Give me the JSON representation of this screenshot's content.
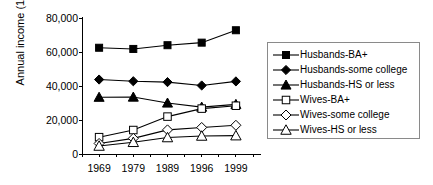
{
  "chart_data": {
    "type": "line",
    "title": "",
    "xlabel": "",
    "ylabel": "Annual income (1999 $)",
    "categories": [
      "1969",
      "1979",
      "1989",
      "1996",
      "1999"
    ],
    "ylim": [
      0,
      80000
    ],
    "ytick_labels": [
      "0",
      "20,000",
      "40,000",
      "60,000",
      "80,000"
    ],
    "ytick_values": [
      0,
      20000,
      40000,
      60000,
      80000
    ],
    "grid": false,
    "legend_position": "right",
    "series": [
      {
        "name": "Husbands-BA+",
        "marker": "filled-square",
        "values": [
          62500,
          61800,
          64000,
          65500,
          72800
        ]
      },
      {
        "name": "Husbands-some college",
        "marker": "filled-diamond",
        "values": [
          43800,
          42800,
          42300,
          40300,
          42700
        ]
      },
      {
        "name": "Husbands-HS or less",
        "marker": "filled-triangle",
        "values": [
          33400,
          33500,
          30000,
          27600,
          29200
        ]
      },
      {
        "name": "Wives-BA+",
        "marker": "open-square",
        "values": [
          9900,
          14100,
          22000,
          26700,
          28400
        ]
      },
      {
        "name": "Wives-some college",
        "marker": "open-diamond",
        "values": [
          6200,
          9200,
          14200,
          15600,
          16900
        ]
      },
      {
        "name": "Wives-HS or less",
        "marker": "open-triangle",
        "values": [
          4700,
          6900,
          9700,
          10600,
          10800
        ]
      }
    ]
  },
  "axes": {
    "y_title": "Annual income (1999 $)"
  },
  "colors": {
    "line": "#000000",
    "axis": "#000000",
    "legend_border": "#8a8a8a",
    "background": "#ffffff"
  }
}
